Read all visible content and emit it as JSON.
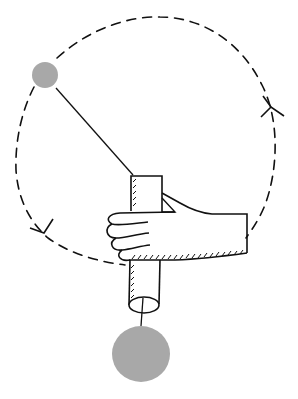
{
  "figure": {
    "title": "Whirling ball on string through tube (centripetal force demonstration)",
    "background": "#ffffff",
    "ink_color": "#111111",
    "ball_color": "#a8a8a8"
  },
  "elements": {
    "orbit": {
      "label": "circular path (dashed)",
      "style": "dashed"
    },
    "small_ball": {
      "label": "whirling ball",
      "cx": 45,
      "cy": 75,
      "r": 13
    },
    "large_ball": {
      "label": "hanging weight",
      "cx": 141,
      "cy": 354,
      "r": 29
    },
    "string": {
      "label": "string"
    },
    "tube": {
      "label": "tube"
    },
    "hand": {
      "label": "hand gripping tube"
    },
    "arrows": [
      {
        "label": "direction arrow right",
        "direction": "up"
      },
      {
        "label": "direction arrow left",
        "direction": "down"
      }
    ]
  }
}
